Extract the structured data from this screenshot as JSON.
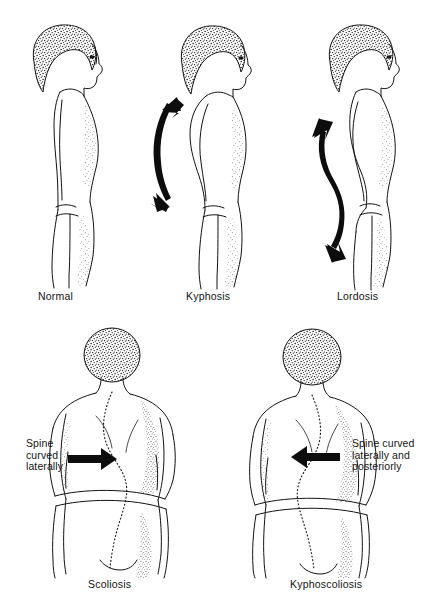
{
  "figure": {
    "background_color": "#ffffff",
    "ink_color": "#121212",
    "panel_count": 5
  },
  "top_row": {
    "panels": [
      {
        "key": "normal",
        "label": "Normal",
        "view": "lateral-profile",
        "facing": "right",
        "arrow": "none",
        "label_x": 38,
        "label_y": 290
      },
      {
        "key": "kyphosis",
        "label": "Kyphosis",
        "view": "lateral-profile",
        "facing": "right",
        "arrow": "double-headed-curved-arrow-thoracic",
        "label_x": 186,
        "label_y": 290
      },
      {
        "key": "lordosis",
        "label": "Lordosis",
        "view": "lateral-profile",
        "facing": "right",
        "arrow": "double-headed-s-curve-arrow-spine",
        "label_x": 337,
        "label_y": 290
      }
    ]
  },
  "bottom_row": {
    "panels": [
      {
        "key": "scoliosis",
        "label": "Scoliosis",
        "view": "posterior",
        "arrow": "solid-right-arrow",
        "annotation": [
          "Spine",
          "curved",
          "laterally"
        ],
        "annotation_text": "Spine curved laterally",
        "annotation_x": 26,
        "annotation_y": 438,
        "label_x": 88,
        "label_y": 578
      },
      {
        "key": "kyphoscoliosis",
        "label": "Kyphoscoliosis",
        "view": "posterior",
        "arrow": "solid-left-arrow",
        "annotation": [
          "Spine curved",
          "laterally and",
          "posteriorly"
        ],
        "annotation_text": "Spine curved laterally and posteriorly",
        "annotation_x": 352,
        "annotation_y": 438,
        "label_x": 290,
        "label_y": 578
      }
    ]
  }
}
